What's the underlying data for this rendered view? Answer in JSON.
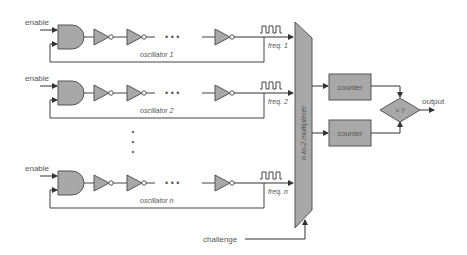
{
  "diagram": {
    "colors": {
      "fill": "#a8a8a8",
      "stroke": "#555555",
      "line": "#444444",
      "text": "#555555",
      "background": "#ffffff"
    },
    "oscillators": [
      {
        "enable_label": "enable",
        "name_label": "oscillator 1",
        "freq_label": "freq. 1"
      },
      {
        "enable_label": "enable",
        "name_label": "oscillator 2",
        "freq_label": "freq. 2"
      },
      {
        "enable_label": "enable",
        "name_label": "oscillator n",
        "freq_label": "freq. n"
      }
    ],
    "ellipsis": "• • •",
    "vertical_ellipsis": "⋮",
    "multiplexer_label": "n-to-2 multiplexer",
    "counters": [
      {
        "label": "counter"
      },
      {
        "label": "counter"
      }
    ],
    "comparator_label": "> ?",
    "output_label": "output",
    "challenge_label": "challenge"
  }
}
